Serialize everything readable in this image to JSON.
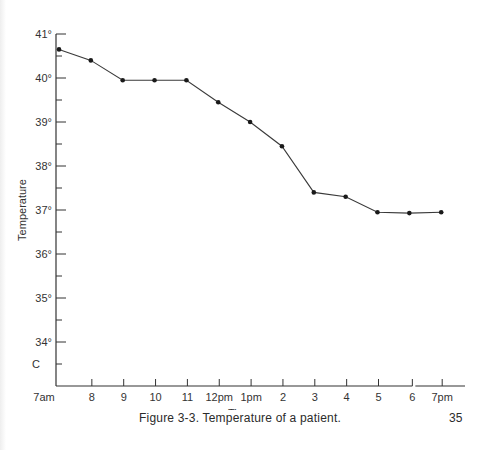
{
  "chart_data": {
    "type": "line",
    "title": "Temperature of a patient.",
    "xlabel": "Time",
    "ylabel": "Temperature",
    "y_unit_label": "C",
    "categories": [
      "7am",
      "8",
      "9",
      "10",
      "11",
      "12pm",
      "1pm",
      "2",
      "3",
      "4",
      "5",
      "6",
      "7pm"
    ],
    "series": [
      {
        "name": "Temperature",
        "values": [
          40.65,
          40.4,
          39.95,
          39.95,
          39.95,
          39.45,
          39.0,
          38.45,
          37.4,
          37.3,
          36.95,
          36.93,
          36.95
        ]
      }
    ],
    "y_ticks": [
      "41°",
      "40°",
      "39°",
      "38°",
      "37°",
      "36°",
      "35°",
      "34°"
    ],
    "y_tick_values": [
      41,
      40,
      39,
      38,
      37,
      36,
      35,
      34
    ],
    "ylim": [
      33.25,
      41
    ],
    "grid": false,
    "legend": "none",
    "minor_y_ticks": "half-degree"
  },
  "figure": {
    "caption": "Figure 3-3.  Temperature of a patient.",
    "page_number": "35"
  },
  "colors": {
    "line": "#3a3a3a",
    "marker": "#1a1a1a",
    "axis": "#333333"
  }
}
